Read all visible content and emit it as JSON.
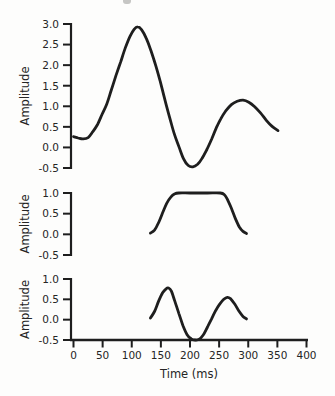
{
  "figure": {
    "background": "#fdfdfc",
    "ink_color": "#1e1e1e",
    "text_color": "#252525"
  },
  "chart_data": [
    {
      "id": "composite-waveform-panel",
      "type": "line",
      "title": "",
      "xlabel": "",
      "ylabel": "Amplitude",
      "xlim": [
        0,
        400
      ],
      "ylim": [
        -0.5,
        3.0
      ],
      "grid": false,
      "legend": false,
      "yticks": [
        3.0,
        2.5,
        2.0,
        1.5,
        1.0,
        0.5,
        0.0,
        -0.5
      ],
      "ytick_labels": [
        "3.0",
        "2.5",
        "2.0",
        "1.5",
        "1.0",
        "0.5",
        "0.0",
        "-0.5"
      ],
      "series": [
        {
          "name": "composite-waveform",
          "points": [
            [
              0,
              0.26
            ],
            [
              8,
              0.23
            ],
            [
              16,
              0.21
            ],
            [
              25,
              0.24
            ],
            [
              33,
              0.38
            ],
            [
              41,
              0.55
            ],
            [
              49,
              0.8
            ],
            [
              57,
              1.05
            ],
            [
              65,
              1.4
            ],
            [
              73,
              1.75
            ],
            [
              81,
              2.08
            ],
            [
              89,
              2.42
            ],
            [
              97,
              2.7
            ],
            [
              104,
              2.87
            ],
            [
              110,
              2.93
            ],
            [
              117,
              2.86
            ],
            [
              125,
              2.65
            ],
            [
              133,
              2.35
            ],
            [
              141,
              2.0
            ],
            [
              149,
              1.6
            ],
            [
              157,
              1.15
            ],
            [
              165,
              0.73
            ],
            [
              173,
              0.33
            ],
            [
              181,
              0.02
            ],
            [
              189,
              -0.28
            ],
            [
              197,
              -0.44
            ],
            [
              205,
              -0.47
            ],
            [
              213,
              -0.41
            ],
            [
              221,
              -0.26
            ],
            [
              229,
              -0.05
            ],
            [
              237,
              0.2
            ],
            [
              245,
              0.47
            ],
            [
              253,
              0.7
            ],
            [
              261,
              0.88
            ],
            [
              271,
              1.04
            ],
            [
              281,
              1.12
            ],
            [
              291,
              1.15
            ],
            [
              301,
              1.1
            ],
            [
              311,
              0.99
            ],
            [
              321,
              0.84
            ],
            [
              331,
              0.66
            ],
            [
              341,
              0.51
            ],
            [
              351,
              0.41
            ]
          ]
        }
      ]
    },
    {
      "id": "window-panel",
      "type": "line",
      "title": "",
      "xlabel": "",
      "ylabel": "Amplitude",
      "xlim": [
        0,
        400
      ],
      "ylim": [
        -0.5,
        1.0
      ],
      "grid": false,
      "legend": false,
      "yticks": [
        1.0,
        0.5,
        0.0,
        -0.5
      ],
      "ytick_labels": [
        "1.0",
        "0.5",
        "0.0",
        "-0.5"
      ],
      "series": [
        {
          "name": "trapezoid-window",
          "points": [
            [
              132,
              0.03
            ],
            [
              139,
              0.1
            ],
            [
              146,
              0.28
            ],
            [
              153,
              0.52
            ],
            [
              160,
              0.75
            ],
            [
              167,
              0.9
            ],
            [
              174,
              0.98
            ],
            [
              181,
              1.0
            ],
            [
              200,
              1.0
            ],
            [
              230,
              1.0
            ],
            [
              252,
              1.0
            ],
            [
              259,
              0.96
            ],
            [
              264,
              0.85
            ],
            [
              271,
              0.63
            ],
            [
              278,
              0.38
            ],
            [
              285,
              0.17
            ],
            [
              291,
              0.07
            ],
            [
              297,
              0.02
            ]
          ]
        }
      ]
    },
    {
      "id": "windowed-component-panel",
      "type": "line",
      "title": "",
      "xlabel": "Time (ms)",
      "ylabel": "Amplitude",
      "xlim": [
        0,
        400
      ],
      "ylim": [
        -0.5,
        1.0
      ],
      "grid": false,
      "legend": false,
      "yticks": [
        1.0,
        0.5,
        0.0,
        -0.5
      ],
      "ytick_labels": [
        "1.0",
        "0.5",
        "0.0",
        "-0.5"
      ],
      "xticks": [
        0,
        50,
        100,
        150,
        200,
        250,
        300,
        350,
        400
      ],
      "xtick_labels": [
        "0",
        "50",
        "100",
        "150",
        "200",
        "250",
        "300",
        "350",
        "400"
      ],
      "series": [
        {
          "name": "windowed-waveform",
          "points": [
            [
              132,
              0.04
            ],
            [
              139,
              0.2
            ],
            [
              146,
              0.45
            ],
            [
              153,
              0.66
            ],
            [
              159,
              0.76
            ],
            [
              163,
              0.78
            ],
            [
              168,
              0.7
            ],
            [
              174,
              0.45
            ],
            [
              181,
              0.15
            ],
            [
              188,
              -0.15
            ],
            [
              195,
              -0.37
            ],
            [
              202,
              -0.47
            ],
            [
              209,
              -0.5
            ],
            [
              216,
              -0.48
            ],
            [
              223,
              -0.37
            ],
            [
              230,
              -0.18
            ],
            [
              237,
              0.02
            ],
            [
              244,
              0.22
            ],
            [
              251,
              0.38
            ],
            [
              258,
              0.5
            ],
            [
              264,
              0.55
            ],
            [
              270,
              0.51
            ],
            [
              277,
              0.38
            ],
            [
              284,
              0.21
            ],
            [
              291,
              0.08
            ],
            [
              297,
              0.02
            ]
          ]
        }
      ]
    }
  ]
}
